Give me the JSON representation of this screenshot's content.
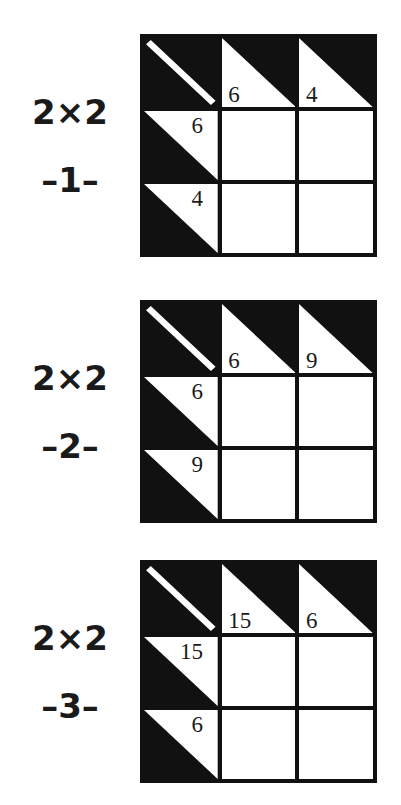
{
  "page": {
    "background_color": "#ffffff",
    "ink_color": "#111111",
    "width": 401,
    "height": 805
  },
  "puzzles": [
    {
      "size_label": "2×2",
      "index_label": "–1–",
      "top_y": 34,
      "grid": {
        "corner": {
          "icon": "diagonal-stripe"
        },
        "column_clues": [
          "6",
          "4"
        ],
        "row_clues": [
          "6",
          "4"
        ],
        "answers": [
          [
            "",
            ""
          ],
          [
            "",
            ""
          ]
        ]
      }
    },
    {
      "size_label": "2×2",
      "index_label": "–2–",
      "top_y": 300,
      "grid": {
        "corner": {
          "icon": "diagonal-stripe"
        },
        "column_clues": [
          "6",
          "9"
        ],
        "row_clues": [
          "6",
          "9"
        ],
        "answers": [
          [
            "",
            ""
          ],
          [
            "",
            ""
          ]
        ]
      }
    },
    {
      "size_label": "2×2",
      "index_label": "–3–",
      "top_y": 560,
      "grid": {
        "corner": {
          "icon": "diagonal-stripe"
        },
        "column_clues": [
          "15",
          "6"
        ],
        "row_clues": [
          "15",
          "6"
        ],
        "answers": [
          [
            "",
            ""
          ],
          [
            "",
            ""
          ]
        ]
      }
    }
  ]
}
